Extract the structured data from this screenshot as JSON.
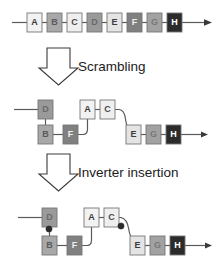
{
  "figure": {
    "width": 223,
    "height": 276,
    "background": "#ffffff",
    "wire_color": "#5a5a5a",
    "box_stroke": "#777777",
    "bubble_color": "#2b2b2b"
  },
  "stages": [
    {
      "id": "original",
      "label": "",
      "boxes": [
        {
          "letter": "A",
          "fill": "#f2f2f2",
          "text_color": "#3a3a3a",
          "x": 27,
          "y": 13
        },
        {
          "letter": "B",
          "fill": "#a8a8a8",
          "text_color": "#5a5a5a",
          "x": 47,
          "y": 13
        },
        {
          "letter": "C",
          "fill": "#efefef",
          "text_color": "#4a4a4a",
          "x": 67,
          "y": 13
        },
        {
          "letter": "D",
          "fill": "#9a9a9a",
          "text_color": "#6a6a6a",
          "x": 87,
          "y": 13
        },
        {
          "letter": "E",
          "fill": "#e4e4e4",
          "text_color": "#3a3a3a",
          "x": 107,
          "y": 13
        },
        {
          "letter": "F",
          "fill": "#808080",
          "text_color": "#f0f0f0",
          "x": 127,
          "y": 13
        },
        {
          "letter": "G",
          "fill": "#a2a2a2",
          "text_color": "#787878",
          "x": 147,
          "y": 13
        },
        {
          "letter": "H",
          "fill": "#2b2b2b",
          "text_color": "#ffffff",
          "x": 167,
          "y": 13
        }
      ]
    },
    {
      "id": "scrambled",
      "label": "Scrambling",
      "boxes": [
        {
          "letter": "D",
          "fill": "#9a9a9a",
          "text_color": "#6a6a6a",
          "x": 38,
          "y": 100
        },
        {
          "letter": "B",
          "fill": "#a8a8a8",
          "text_color": "#5a5a5a",
          "x": 38,
          "y": 125
        },
        {
          "letter": "F",
          "fill": "#808080",
          "text_color": "#f0f0f0",
          "x": 63,
          "y": 125
        },
        {
          "letter": "A",
          "fill": "#f2f2f2",
          "text_color": "#3a3a3a",
          "x": 80,
          "y": 100
        },
        {
          "letter": "C",
          "fill": "#efefef",
          "text_color": "#4a4a4a",
          "x": 100,
          "y": 100
        },
        {
          "letter": "E",
          "fill": "#e4e4e4",
          "text_color": "#3a3a3a",
          "x": 126,
          "y": 125
        },
        {
          "letter": "G",
          "fill": "#a2a2a2",
          "text_color": "#787878",
          "x": 146,
          "y": 125
        },
        {
          "letter": "H",
          "fill": "#2b2b2b",
          "text_color": "#ffffff",
          "x": 166,
          "y": 125
        }
      ]
    },
    {
      "id": "inverted",
      "label": "Inverter insertion",
      "boxes": [
        {
          "letter": "D",
          "fill": "#9a9a9a",
          "text_color": "#6a6a6a",
          "x": 42,
          "y": 208
        },
        {
          "letter": "B",
          "fill": "#a8a8a8",
          "text_color": "#5a5a5a",
          "x": 42,
          "y": 236
        },
        {
          "letter": "F",
          "fill": "#808080",
          "text_color": "#f0f0f0",
          "x": 67,
          "y": 236
        },
        {
          "letter": "A",
          "fill": "#f2f2f2",
          "text_color": "#3a3a3a",
          "x": 84,
          "y": 208
        },
        {
          "letter": "C",
          "fill": "#efefef",
          "text_color": "#4a4a4a",
          "x": 104,
          "y": 208
        },
        {
          "letter": "E",
          "fill": "#e4e4e4",
          "text_color": "#3a3a3a",
          "x": 130,
          "y": 236
        },
        {
          "letter": "G",
          "fill": "#a2a2a2",
          "text_color": "#787878",
          "x": 150,
          "y": 236
        },
        {
          "letter": "H",
          "fill": "#2b2b2b",
          "text_color": "#ffffff",
          "x": 170,
          "y": 236
        }
      ],
      "inverters": [
        {
          "name": "inverter-bubble-d-b",
          "cx": 49,
          "cy": 229
        },
        {
          "name": "inverter-bubble-c-e",
          "cx": 121,
          "cy": 226
        }
      ]
    }
  ],
  "box_size": {
    "w": 15,
    "h": 19
  },
  "transitions": [
    {
      "id": "scrambling",
      "label": "Scrambling",
      "label_x": 78,
      "label_y": 71
    },
    {
      "id": "inverter-insertion",
      "label": "Inverter insertion",
      "label_x": 78,
      "label_y": 177
    }
  ]
}
